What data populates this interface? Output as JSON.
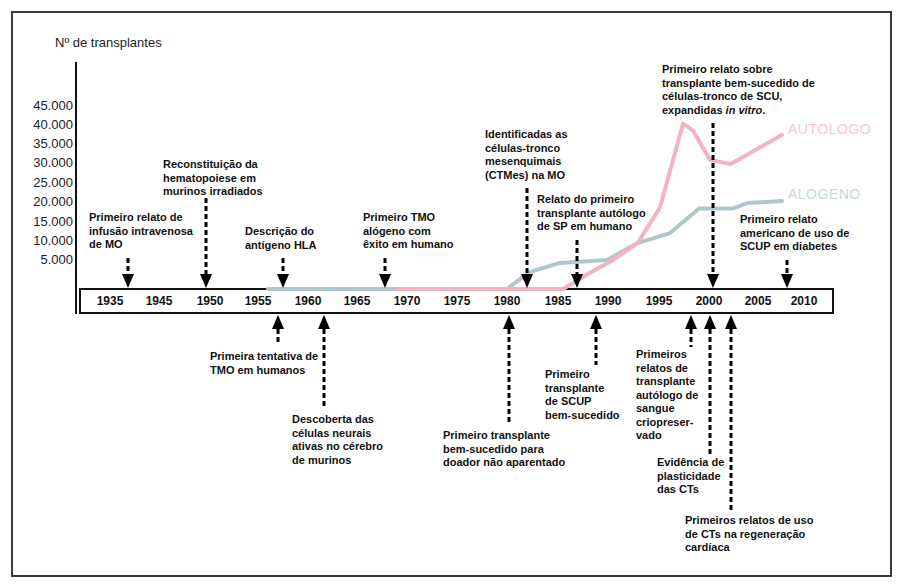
{
  "chart_data": {
    "type": "line",
    "title": "",
    "xlabel": "",
    "ylabel": "Nº de transplantes",
    "ylim": [
      0,
      45000
    ],
    "grid": false,
    "legend": "inline labels at right end of each line",
    "yticks": [
      "45.000",
      "40.000",
      "35.000",
      "30.000",
      "25.000",
      "20.000",
      "15.000",
      "10.000",
      "5.000"
    ],
    "xticks": [
      "1935",
      "1945",
      "1950",
      "1955",
      "1960",
      "1965",
      "1970",
      "1975",
      "1980",
      "1985",
      "1990",
      "1995",
      "2000",
      "2005",
      "2010"
    ],
    "series": [
      {
        "name": "ALOGENO",
        "color": "#b0c6cb",
        "label_color": "#c5d9df",
        "x": [
          1956,
          1980,
          1982.2,
          1985.2,
          1989.9,
          1992.9,
          1996.1,
          1999,
          2002.5,
          2003.9,
          2007.6
        ],
        "values": [
          0,
          0,
          2900,
          4500,
          5000,
          9400,
          12000,
          18400,
          18400,
          19800,
          20300
        ]
      },
      {
        "name": "AUTOLOGO",
        "color": "#f2b3c3",
        "label_color": "#f5c6d1",
        "x": [
          1969.1,
          1985.5,
          1988.2,
          1990.5,
          1992.9,
          1995.1,
          1997.4,
          1998.4,
          2000.1,
          2002.2,
          2007.6
        ],
        "values": [
          0,
          0,
          2800,
          5000,
          9400,
          18600,
          40400,
          38600,
          31000,
          29900,
          37500
        ]
      }
    ],
    "annotations": {
      "top": [
        {
          "year_approx": 1939,
          "lines": [
            "Primeiro relato de",
            "infusão intravenosa",
            "de MO"
          ]
        },
        {
          "year_approx": 1950,
          "lines": [
            "Reconstituição da",
            "hematopoiese em",
            "murinos irradiados"
          ]
        },
        {
          "year_approx": 1958,
          "lines": [
            "Descrição do",
            "antígeno HLA"
          ]
        },
        {
          "year_approx": 1968,
          "lines": [
            "Primeiro TMO",
            "alógeno com",
            "êxito em humano"
          ]
        },
        {
          "year_approx": 1982,
          "lines": [
            "Identificadas as",
            "células-tronco",
            "mesenquimais",
            "(CTMes) na MO"
          ]
        },
        {
          "year_approx": 1987,
          "lines": [
            "Relato do primeiro",
            "transplante autólogo",
            "de SP em humano"
          ]
        },
        {
          "year_approx": 2000,
          "lines": [
            "Primeiro relato sobre",
            "transplante bem-sucedido de",
            "células-tronco de SCU,"
          ],
          "last_line": {
            "prefix": "expandidas ",
            "italic": "in vitro",
            "suffix": "."
          }
        },
        {
          "year_approx": 2008,
          "lines": [
            "Primeiro relato",
            "americano de uso de",
            "SCUP em diabetes"
          ]
        }
      ],
      "bottom": [
        {
          "year_approx": 1957,
          "lines": [
            "Primeira tentativa de",
            "TMO em humanos"
          ]
        },
        {
          "year_approx": 1961,
          "lines": [
            "Descoberta das",
            "células neurais",
            "ativas no cérebro",
            "de murinos"
          ]
        },
        {
          "year_approx": 1980,
          "lines": [
            "Primeiro transplante",
            "bem-sucedido para",
            "doador não aparentado"
          ]
        },
        {
          "year_approx": 1988,
          "lines": [
            "Primeiro",
            "transplante",
            "de SCUP",
            "bem-sucedido"
          ]
        },
        {
          "year_approx": 1998,
          "lines": [
            "Primeiros",
            "relatos de",
            "transplante",
            "autólogo de",
            "sangue",
            "criopreser-",
            "vado"
          ]
        },
        {
          "year_approx": 2000,
          "lines": [
            "Evidência de",
            "plasticidade",
            "das CTs"
          ]
        },
        {
          "year_approx": 2002,
          "lines": [
            "Primeiros relatos de uso",
            "de CTs na regeneração",
            "cardíaca"
          ]
        }
      ]
    }
  }
}
